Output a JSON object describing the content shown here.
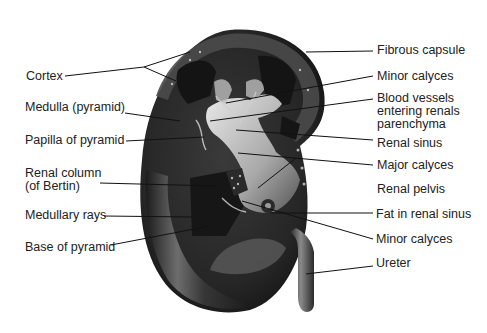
{
  "diagram": {
    "colors": {
      "background": "#ffffff",
      "text": "#222222",
      "line": "#111111",
      "tissue_dark": "#1e1e1e",
      "tissue_mid": "#4a4a4a",
      "sinus_light": "#cfcfcf"
    },
    "labels_left": [
      {
        "id": "cortex",
        "text": "Cortex"
      },
      {
        "id": "medulla",
        "text": "Medulla (pyramid)"
      },
      {
        "id": "papilla",
        "text": "Papilla of pyramid"
      },
      {
        "id": "renal-column-1",
        "text": "Renal column"
      },
      {
        "id": "renal-column-2",
        "text": "(of Bertin)"
      },
      {
        "id": "medullary-rays",
        "text": "Medullary rays"
      },
      {
        "id": "base-pyramid",
        "text": "Base of pyramid"
      }
    ],
    "labels_right": [
      {
        "id": "fibrous-capsule",
        "text": "Fibrous capsule"
      },
      {
        "id": "minor-calyces-top",
        "text": "Minor calyces"
      },
      {
        "id": "blood-vessels-1",
        "text": "Blood vessels"
      },
      {
        "id": "blood-vessels-2",
        "text": "entering renals"
      },
      {
        "id": "blood-vessels-3",
        "text": "parenchyma"
      },
      {
        "id": "renal-sinus",
        "text": "Renal sinus"
      },
      {
        "id": "major-calyces",
        "text": "Major calyces"
      },
      {
        "id": "renal-pelvis",
        "text": "Renal pelvis"
      },
      {
        "id": "fat-renal-sinus",
        "text": "Fat in renal sinus"
      },
      {
        "id": "minor-calyces-bottom",
        "text": "Minor calyces"
      },
      {
        "id": "ureter",
        "text": "Ureter"
      }
    ]
  }
}
